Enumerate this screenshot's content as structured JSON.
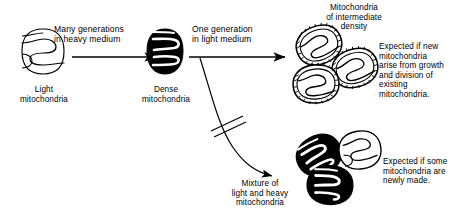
{
  "diagram": {
    "title_semantic": "mitochondria-density-labeling-experiment",
    "background_color": "#ffffff",
    "ink_color": "#000000"
  },
  "stages": {
    "light": {
      "label": "Light\nmitochondria",
      "icon": "mitochondrion-outline-icon",
      "fill": "#ffffff",
      "stroke": "#000000"
    },
    "dense": {
      "label": "Dense\nmitochondria",
      "icon": "mitochondrion-solid-dark-icon",
      "fill": "#000000",
      "stroke": "#000000"
    },
    "intermediate": {
      "label": "Mitochondria\nof intermediate\ndensity",
      "icon": "mitochondria-cluster-intermediate-icon",
      "count": 3
    },
    "mixture": {
      "label": "Mixture of\nlight and heavy\nmitochondria",
      "icon": "mitochondria-cluster-mixed-icon",
      "count": 3
    }
  },
  "arrows": {
    "first": {
      "label": "Many generations\nin heavy medium",
      "icon": "arrow-right-icon"
    },
    "second": {
      "label": "One generation\nin light medium",
      "icon": "arrow-right-icon"
    },
    "branch": {
      "icon": "curved-arrow-interrupted-icon",
      "interrupt_marks": 2
    }
  },
  "conclusions": {
    "growth_division": "Expected if new\nmitochondria\narise from growth\nand division of\nexisting\nmitochondria.",
    "newly_made": "Expected if some\nmitochondria are\nnewly made."
  }
}
